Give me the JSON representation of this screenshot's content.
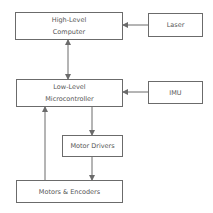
{
  "diagram": {
    "type": "block-diagram",
    "nodes": {
      "high_level": {
        "line1": "High-Level",
        "line2": "Computer"
      },
      "laser": {
        "label": "Laser"
      },
      "low_level": {
        "line1": "Low-Level",
        "line2": "Microcontroller"
      },
      "imu": {
        "label": "IMU"
      },
      "motor_drivers": {
        "label": "Motor Drivers"
      },
      "motors_encoders": {
        "label": "Motors & Encoders"
      }
    },
    "edges": [
      {
        "from": "Laser",
        "to": "High-Level Computer",
        "direction": "one-way"
      },
      {
        "from": "High-Level Computer",
        "to": "Low-Level Microcontroller",
        "direction": "bidirectional"
      },
      {
        "from": "IMU",
        "to": "Low-Level Microcontroller",
        "direction": "one-way"
      },
      {
        "from": "Low-Level Microcontroller",
        "to": "Motor Drivers",
        "direction": "one-way"
      },
      {
        "from": "Motor Drivers",
        "to": "Motors & Encoders",
        "direction": "one-way"
      },
      {
        "from": "Motors & Encoders",
        "to": "Low-Level Microcontroller",
        "direction": "one-way"
      }
    ],
    "colors": {
      "stroke": "#6b6b6b",
      "text": "#555555",
      "background": "#ffffff"
    }
  }
}
